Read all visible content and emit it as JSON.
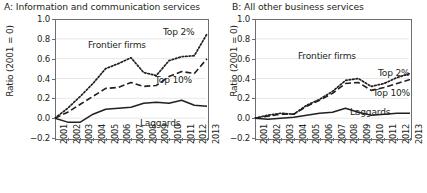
{
  "figure": {
    "ylabel": "Ratio (2001 = 0)",
    "y_ticks": [
      "1.0",
      "0.8",
      "0.6",
      "0.4",
      "0.2",
      "0.0",
      "-0.2"
    ],
    "x_ticks": [
      "2001",
      "2002",
      "2003",
      "2004",
      "2005",
      "2006",
      "2007",
      "2008",
      "2009",
      "2010",
      "2011",
      "2012",
      "2013"
    ],
    "series_labels": {
      "frontier": "Frontier firms",
      "top2": "Top 2%",
      "top10": "Top 10%",
      "laggards": "Laggards"
    },
    "colors": {
      "line": "#231f20",
      "axis": "#6d6e71",
      "grid": "#e8e8e8",
      "background": "#ffffff"
    }
  },
  "panels": [
    {
      "id": "a",
      "title": "A: Information and communication services"
    },
    {
      "id": "b",
      "title": "B: All other business services"
    }
  ],
  "chart_data": [
    {
      "type": "line",
      "title": "A: Information and communication services",
      "xlabel": "",
      "ylabel": "Ratio (2001 = 0)",
      "x": [
        2001,
        2002,
        2003,
        2004,
        2005,
        2006,
        2007,
        2008,
        2009,
        2010,
        2011,
        2012,
        2013
      ],
      "xlim": [
        2001,
        2013
      ],
      "ylim": [
        -0.2,
        1.0
      ],
      "grid": true,
      "legend": "inline-annotations",
      "series": [
        {
          "name": "Top 2%",
          "style": "dotted",
          "values": [
            0.0,
            0.1,
            0.22,
            0.35,
            0.5,
            0.55,
            0.61,
            0.46,
            0.43,
            0.58,
            0.62,
            0.63,
            0.85
          ]
        },
        {
          "name": "Top 10%",
          "style": "dashed",
          "values": [
            0.0,
            0.06,
            0.14,
            0.22,
            0.3,
            0.31,
            0.36,
            0.32,
            0.33,
            0.42,
            0.47,
            0.45,
            0.6
          ]
        },
        {
          "name": "Laggards",
          "style": "solid",
          "values": [
            0.0,
            -0.04,
            -0.04,
            0.04,
            0.09,
            0.1,
            0.11,
            0.15,
            0.16,
            0.15,
            0.18,
            0.13,
            0.12
          ]
        }
      ]
    },
    {
      "type": "line",
      "title": "B: All other business services",
      "xlabel": "",
      "ylabel": "Ratio (2001 = 0)",
      "x": [
        2001,
        2002,
        2003,
        2004,
        2005,
        2006,
        2007,
        2008,
        2009,
        2010,
        2011,
        2012,
        2013
      ],
      "xlim": [
        2001,
        2013
      ],
      "ylim": [
        -0.2,
        1.0
      ],
      "grid": true,
      "legend": "inline-annotations",
      "series": [
        {
          "name": "Top 2%",
          "style": "dotted",
          "values": [
            0.0,
            0.03,
            0.05,
            0.04,
            0.13,
            0.19,
            0.27,
            0.38,
            0.4,
            0.32,
            0.35,
            0.41,
            0.45
          ]
        },
        {
          "name": "Top 10%",
          "style": "dashed",
          "values": [
            0.0,
            0.02,
            0.04,
            0.04,
            0.12,
            0.18,
            0.25,
            0.35,
            0.36,
            0.28,
            0.31,
            0.35,
            0.39
          ]
        },
        {
          "name": "Laggards",
          "style": "solid",
          "values": [
            0.0,
            -0.01,
            0.0,
            0.01,
            0.03,
            0.05,
            0.06,
            0.1,
            0.06,
            0.03,
            0.04,
            0.05,
            0.05
          ]
        }
      ]
    }
  ]
}
